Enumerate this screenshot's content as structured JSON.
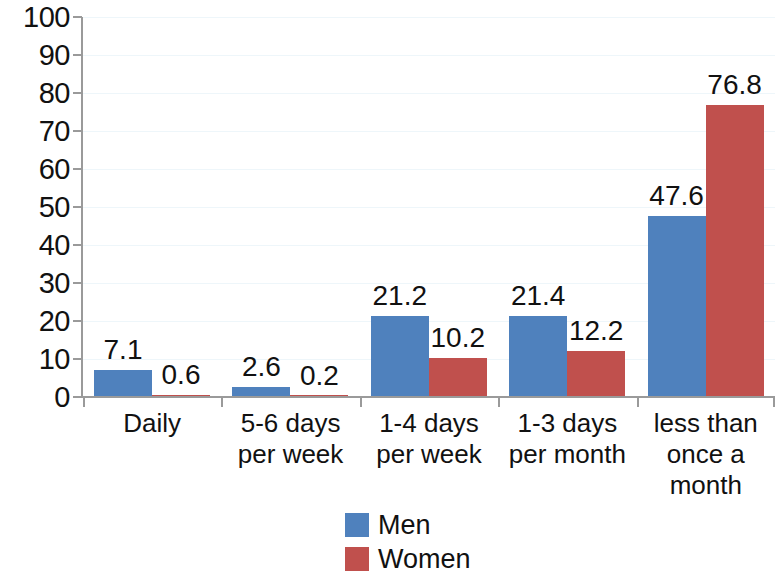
{
  "chart_data": {
    "type": "bar",
    "title": "",
    "subtitle": "",
    "xlabel": "",
    "ylabel": "",
    "ylim": [
      0,
      100
    ],
    "ytick_step": 10,
    "ytick_labels": [
      "100",
      "90",
      "80",
      "70",
      "60",
      "50",
      "40",
      "30",
      "20",
      "10",
      "0"
    ],
    "grid": true,
    "grid_axis": "y",
    "legend_position": "bottom-center",
    "categories": [
      "Daily",
      "5-6 days\nper week",
      "1-4 days\nper week",
      "1-3 days\nper month",
      "less than\nonce a\nmonth"
    ],
    "category_lines": [
      [
        "Daily"
      ],
      [
        "5-6 days",
        "per week"
      ],
      [
        "1-4 days",
        "per week"
      ],
      [
        "1-3 days",
        "per month"
      ],
      [
        "less than",
        "once a",
        "month"
      ]
    ],
    "series": [
      {
        "name": "Men",
        "color": "#4f81bd",
        "values": [
          7.1,
          2.6,
          21.2,
          21.4,
          47.6
        ],
        "labels": [
          "7.1",
          "2.6",
          "21.2",
          "21.4",
          "47.6"
        ]
      },
      {
        "name": "Women",
        "color": "#c0504d",
        "values": [
          0.6,
          0.2,
          10.2,
          12.2,
          76.8
        ],
        "labels": [
          "0.6",
          "0.2",
          "10.2",
          "12.2",
          "76.8"
        ]
      }
    ]
  },
  "legend": {
    "items": [
      {
        "label": "Men",
        "color": "#4f81bd"
      },
      {
        "label": "Women",
        "color": "#c0504d"
      }
    ]
  },
  "colors": {
    "men": "#4f81bd",
    "women": "#c0504d",
    "axis": "#9a9a9a",
    "gridline": "#eef6fa",
    "text": "#111111",
    "background": "#ffffff"
  }
}
